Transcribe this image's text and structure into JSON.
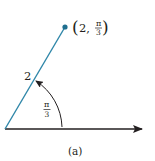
{
  "figure": {
    "point_label": {
      "open_paren": "(",
      "r": "2,",
      "theta_num": "π",
      "theta_den": "3",
      "close_paren": ")"
    },
    "radius_label": "2",
    "angle_label": {
      "num": "π",
      "den": "3"
    },
    "caption": "(a)",
    "polar_point": {
      "r": 2,
      "theta": "π/3"
    },
    "colors": {
      "ray": "#2e86a8",
      "axis": "#231f20",
      "point": "#1f6f8f"
    }
  }
}
